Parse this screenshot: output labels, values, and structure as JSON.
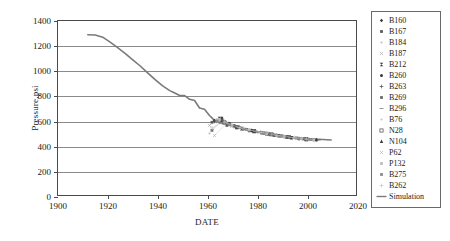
{
  "chart_data": {
    "type": "line",
    "title": "",
    "xlabel": "DATE",
    "ylabel": "Pressure,psi",
    "xlim": [
      1900,
      2020
    ],
    "ylim": [
      0,
      1400
    ],
    "xticks": [
      1900,
      1920,
      1940,
      1960,
      1980,
      2000,
      2020
    ],
    "yticks": [
      0,
      200,
      400,
      600,
      800,
      1000,
      1200,
      1400
    ],
    "grid": "horizontal",
    "legend_position": "right-outside",
    "series": [
      {
        "name": "Simulation",
        "marker": "line",
        "color": "#7a7a7a",
        "x": [
          1912,
          1915,
          1918,
          1921,
          1924,
          1927,
          1930,
          1933,
          1936,
          1939,
          1942,
          1945,
          1947,
          1949,
          1951,
          1953,
          1955,
          1957,
          1959,
          1961,
          1963,
          1965,
          1968,
          1972,
          1976,
          1980,
          1985,
          1990,
          1995,
          2000,
          2005,
          2010
        ],
        "y": [
          1290,
          1288,
          1270,
          1230,
          1185,
          1140,
          1090,
          1040,
          985,
          930,
          880,
          840,
          820,
          800,
          800,
          770,
          760,
          700,
          690,
          640,
          600,
          580,
          570,
          545,
          525,
          510,
          495,
          480,
          465,
          455,
          448,
          443
        ]
      },
      {
        "name": "B160",
        "marker": "filled-diamond",
        "color": "#3a3a3a",
        "x": [
          1963,
          1966,
          1969,
          1973,
          1978,
          1983,
          1988,
          1993,
          1998
        ],
        "y": [
          600,
          620,
          575,
          548,
          520,
          500,
          482,
          466,
          455
        ]
      },
      {
        "name": "B167",
        "marker": "filled-square",
        "color": "#5a5a5a",
        "x": [
          1962,
          1965,
          1968,
          1972,
          1977,
          1982,
          1987,
          1992,
          1997
        ],
        "y": [
          585,
          612,
          560,
          540,
          516,
          498,
          478,
          464,
          452
        ]
      },
      {
        "name": "B184",
        "marker": "dot",
        "color": "#b5b5b5",
        "x": [
          1964,
          1967,
          1971,
          1975,
          1980,
          1986,
          1991,
          1996,
          2001
        ],
        "y": [
          608,
          590,
          556,
          530,
          510,
          490,
          472,
          458,
          448
        ]
      },
      {
        "name": "B187",
        "marker": "x-small",
        "color": "#a8a8a8",
        "x": [
          1961,
          1964,
          1967,
          1970,
          1975,
          1981,
          1986,
          1992,
          1999
        ],
        "y": [
          560,
          598,
          582,
          552,
          528,
          504,
          484,
          464,
          450
        ]
      },
      {
        "name": "B212",
        "marker": "bowtie",
        "color": "#3a3a3a",
        "x": [
          1965,
          1969,
          1974,
          1979,
          1984,
          1989,
          1994,
          2000
        ],
        "y": [
          615,
          570,
          534,
          512,
          494,
          476,
          460,
          447
        ]
      },
      {
        "name": "B260",
        "marker": "filled-circle",
        "color": "#3a3a3a",
        "x": [
          1966,
          1970,
          1976,
          1982,
          1988,
          1994,
          2000,
          2004
        ],
        "y": [
          605,
          562,
          528,
          500,
          480,
          462,
          448,
          442
        ]
      },
      {
        "name": "B263",
        "marker": "plus",
        "color": "#4a4a4a",
        "x": [
          1963,
          1967,
          1972,
          1978,
          1985,
          1991,
          1997,
          2003
        ],
        "y": [
          592,
          586,
          544,
          518,
          492,
          470,
          454,
          444
        ]
      },
      {
        "name": "B269",
        "marker": "small-square",
        "color": "#6a6a6a",
        "x": [
          1962,
          1966,
          1971,
          1977,
          1983,
          1990,
          1996,
          2002
        ],
        "y": [
          520,
          600,
          558,
          522,
          496,
          474,
          458,
          446
        ]
      },
      {
        "name": "B296",
        "marker": "dash",
        "color": "#7a7a7a",
        "x": [
          1964,
          1968,
          1973,
          1980,
          1987,
          1993,
          1999,
          2005
        ],
        "y": [
          596,
          576,
          540,
          508,
          486,
          466,
          450,
          441
        ]
      },
      {
        "name": "B76",
        "marker": "faint-dot",
        "color": "#c0c0c0",
        "x": [
          1961,
          1965,
          1970,
          1976,
          1984,
          1992,
          1998
        ],
        "y": [
          495,
          604,
          554,
          526,
          492,
          468,
          452
        ]
      },
      {
        "name": "N28",
        "marker": "hollow-square",
        "color": "#4a4a4a",
        "x": [
          1967,
          1972,
          1979,
          1986,
          1993,
          2000
        ],
        "y": [
          584,
          546,
          514,
          488,
          466,
          449
        ]
      },
      {
        "name": "N104",
        "marker": "filled-triangle",
        "color": "#3a3a3a",
        "x": [
          1966,
          1971,
          1978,
          1985,
          1992,
          1999,
          2004
        ],
        "y": [
          598,
          556,
          518,
          490,
          468,
          452,
          443
        ]
      },
      {
        "name": "P62",
        "marker": "x-faint",
        "color": "#b0b0b0",
        "x": [
          1963,
          1968,
          1974,
          1981,
          1989,
          1996,
          2002
        ],
        "y": [
          478,
          580,
          536,
          506,
          478,
          458,
          446
        ]
      },
      {
        "name": "P132",
        "marker": "faint-square",
        "color": "#bcbcbc",
        "x": [
          1965,
          1970,
          1977,
          1984,
          1991,
          1998,
          2003
        ],
        "y": [
          610,
          560,
          524,
          494,
          470,
          454,
          444
        ]
      },
      {
        "name": "B275",
        "marker": "grey-square",
        "color": "#8a8a8a",
        "x": [
          1964,
          1969,
          1975,
          1983,
          1990,
          1997,
          2001
        ],
        "y": [
          594,
          566,
          530,
          498,
          474,
          456,
          448
        ]
      },
      {
        "name": "B262",
        "marker": "faint-plus",
        "color": "#c4c4c4",
        "x": [
          1962,
          1967,
          1973,
          1982,
          1988,
          1995,
          2000
        ],
        "y": [
          540,
          588,
          542,
          502,
          480,
          460,
          450
        ]
      }
    ]
  },
  "axes": {
    "ylabel": "Pressure,psi",
    "xlabel": "DATE",
    "yticks": [
      "0",
      "200",
      "400",
      "600",
      "800",
      "1000",
      "1200",
      "1400"
    ],
    "xticks": [
      "1900",
      "1920",
      "1940",
      "1960",
      "1980",
      "2000",
      "2020"
    ]
  },
  "legend": {
    "items": [
      {
        "label": "B160",
        "marker": "filled-diamond",
        "color": "#3a3a3a"
      },
      {
        "label": "B167",
        "marker": "filled-square",
        "color": "#5a5a5a"
      },
      {
        "label": "B184",
        "marker": "dot",
        "color": "#c0c0c0"
      },
      {
        "label": "B187",
        "marker": "x-small",
        "color": "#aaaaaa"
      },
      {
        "label": "B212",
        "marker": "bowtie",
        "color": "#3a3a3a"
      },
      {
        "label": "B260",
        "marker": "filled-circle",
        "color": "#3a3a3a"
      },
      {
        "label": "B263",
        "marker": "plus",
        "color": "#4a4a4a"
      },
      {
        "label": "B269",
        "marker": "small-square",
        "color": "#6a6a6a"
      },
      {
        "label": "B296",
        "marker": "dash",
        "color": "#7a7a7a"
      },
      {
        "label": "B76",
        "marker": "faint-dot",
        "color": "#c8c8c8"
      },
      {
        "label": "N28",
        "marker": "hollow-square",
        "color": "#4a4a4a"
      },
      {
        "label": "N104",
        "marker": "filled-triangle",
        "color": "#3a3a3a"
      },
      {
        "label": "P62",
        "marker": "x-faint",
        "color": "#b4b4b4"
      },
      {
        "label": "P132",
        "marker": "faint-square",
        "color": "#bcbcbc"
      },
      {
        "label": "B275",
        "marker": "grey-square",
        "color": "#8a8a8a"
      },
      {
        "label": "B262",
        "marker": "faint-plus",
        "color": "#c4c4c4"
      },
      {
        "label": "Simulation",
        "marker": "line",
        "color": "#7a7a7a"
      }
    ]
  },
  "colors": {
    "frame": "#4a4a4a",
    "grid": "#8a8a8a",
    "simulation": "#7a7a7a",
    "background": "#ffffff"
  }
}
